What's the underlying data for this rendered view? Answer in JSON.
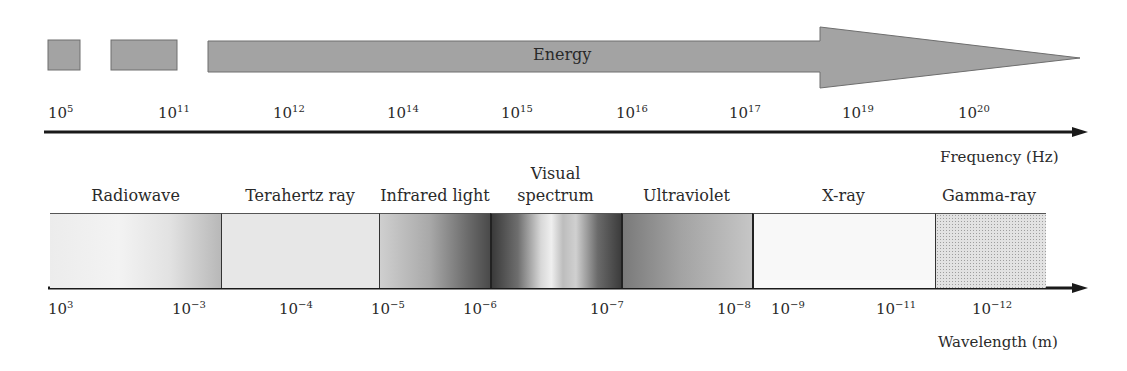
{
  "energy_arrow": {
    "label": "Energy",
    "fill_color": "#a3a3a3",
    "stroke_color": "#6e6e6e"
  },
  "frequency_axis": {
    "title": "Frequency (Hz)",
    "ticks": [
      {
        "base": "10",
        "exp": "5"
      },
      {
        "base": "10",
        "exp": "11"
      },
      {
        "base": "10",
        "exp": "12"
      },
      {
        "base": "10",
        "exp": "14"
      },
      {
        "base": "10",
        "exp": "15"
      },
      {
        "base": "10",
        "exp": "16"
      },
      {
        "base": "10",
        "exp": "17"
      },
      {
        "base": "10",
        "exp": "19"
      },
      {
        "base": "10",
        "exp": "20"
      }
    ]
  },
  "bands": [
    {
      "label": "Radiowave"
    },
    {
      "label": "Terahertz ray"
    },
    {
      "label": "Infrared light"
    },
    {
      "label_line1": "Visual",
      "label_line2": "spectrum"
    },
    {
      "label": "Ultraviolet"
    },
    {
      "label": "X-ray"
    },
    {
      "label": "Gamma-ray"
    }
  ],
  "wavelength_axis": {
    "title": "Wavelength (m)",
    "ticks": [
      {
        "base": "10",
        "exp": "3"
      },
      {
        "base": "10",
        "exp": "−3"
      },
      {
        "base": "10",
        "exp": "−4"
      },
      {
        "base": "10",
        "exp": "−5"
      },
      {
        "base": "10",
        "exp": "−6"
      },
      {
        "base": "10",
        "exp": "−7"
      },
      {
        "base": "10",
        "exp": "−8"
      },
      {
        "base": "10",
        "exp": "−9"
      },
      {
        "base": "10",
        "exp": "−11"
      },
      {
        "base": "10",
        "exp": "−12"
      }
    ]
  }
}
